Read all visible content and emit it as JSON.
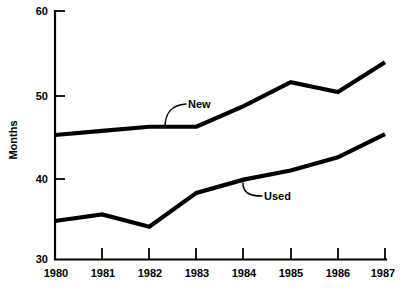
{
  "chart_data": {
    "type": "line",
    "title": "",
    "xlabel": "",
    "ylabel": "Months",
    "x": [
      1980,
      1981,
      1982,
      1983,
      1984,
      1985,
      1986,
      1987
    ],
    "categories": [
      "1980",
      "1981",
      "1982",
      "1983",
      "1984",
      "1985",
      "1986",
      "1987"
    ],
    "xlim": [
      1980,
      1987
    ],
    "ylim": [
      30,
      60
    ],
    "yticks": [
      30,
      40,
      50,
      60
    ],
    "ytick_labels": [
      "30",
      "40",
      "50",
      "60"
    ],
    "xticks": [
      1980,
      1981,
      1982,
      1983,
      1984,
      1985,
      1986,
      1987
    ],
    "xtick_labels": [
      "1980",
      "1981",
      "1982",
      "1983",
      "1984",
      "1985",
      "1986",
      "1987"
    ],
    "grid": false,
    "legend": "inline-labels",
    "series": [
      {
        "name": "New",
        "values": [
          45.0,
          45.5,
          46.0,
          46.0,
          48.5,
          51.4,
          50.2,
          53.8
        ],
        "color": "#000000",
        "label_position": "above-left-of-1983"
      },
      {
        "name": "Used",
        "values": [
          34.6,
          35.4,
          33.9,
          38.0,
          39.6,
          40.7,
          42.3,
          45.1
        ],
        "color": "#000000",
        "label_position": "below-right-of-1984"
      }
    ],
    "annotations": [
      {
        "text": "New",
        "anchor_year": 1983,
        "anchor_value": 46.0
      },
      {
        "text": "Used",
        "anchor_year": 1984,
        "anchor_value": 39.6
      }
    ]
  },
  "axis": {
    "y_title": "Months",
    "y_tick_0": "30",
    "y_tick_1": "40",
    "y_tick_2": "50",
    "y_tick_3": "60",
    "x_tick_0": "1980",
    "x_tick_1": "1981",
    "x_tick_2": "1982",
    "x_tick_3": "1983",
    "x_tick_4": "1984",
    "x_tick_5": "1985",
    "x_tick_6": "1986",
    "x_tick_7": "1987"
  },
  "labels": {
    "series_new": "New",
    "series_used": "Used"
  }
}
